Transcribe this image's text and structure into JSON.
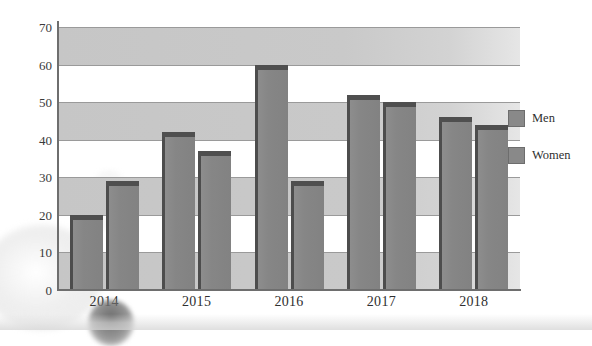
{
  "chart_data": {
    "type": "bar",
    "title": "",
    "xlabel": "",
    "ylabel": "",
    "categories": [
      "2014",
      "2015",
      "2016",
      "2017",
      "2018"
    ],
    "series": [
      {
        "name": "Men",
        "color": "#878787",
        "values": [
          20,
          42,
          60,
          52,
          46
        ]
      },
      {
        "name": "Women",
        "color": "#878787",
        "values": [
          29,
          37,
          29,
          50,
          44
        ]
      }
    ],
    "ylim": [
      0,
      70
    ],
    "ytick_labels": [
      "0",
      "10",
      "20",
      "30",
      "40",
      "50",
      "60",
      "70"
    ],
    "ytick_values": [
      0,
      10,
      20,
      30,
      40,
      50,
      60,
      70
    ],
    "grid": true,
    "grid_bands": "alternating gray bands every 10 units",
    "legend_position": "right",
    "style": "3d-bars-grayscale"
  },
  "legend": {
    "items": [
      {
        "label": "Men"
      },
      {
        "label": "Women"
      }
    ]
  },
  "axes": {
    "y_ticks": [
      "0",
      "10",
      "20",
      "30",
      "40",
      "50",
      "60",
      "70"
    ],
    "x_ticks": [
      "2014",
      "2015",
      "2016",
      "2017",
      "2018"
    ]
  },
  "colors": {
    "bar_face": "#878787",
    "bar_edge": "#4d4d4d",
    "band": "#c9c9c9",
    "gridline": "#9a9a9a",
    "axis": "#6e6e6e",
    "text": "#2f2f2f"
  }
}
